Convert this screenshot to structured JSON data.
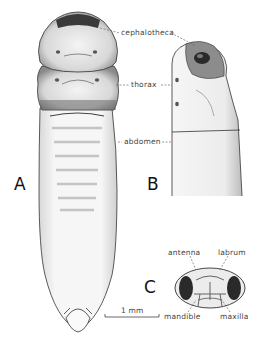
{
  "figure": {
    "panels": [
      {
        "id": "A",
        "label": "A",
        "description": "dorsal view of pupa"
      },
      {
        "id": "B",
        "label": "B",
        "description": "lateral view of anterior end"
      },
      {
        "id": "C",
        "label": "C",
        "description": "frontal view of cephalotheca"
      }
    ],
    "labels": {
      "cephalotheca": "cephalotheca",
      "thorax": "thorax",
      "abdomen": "abdomen",
      "antenna": "antenna",
      "labrum": "labrum",
      "mandible": "mandible",
      "maxilla": "maxilla"
    },
    "scale_bar": {
      "label": "1 mm"
    },
    "colors": {
      "ink": "#222222",
      "stipple": "#9a9a9a",
      "dark": "#3a3a3a",
      "background": "#ffffff"
    }
  }
}
